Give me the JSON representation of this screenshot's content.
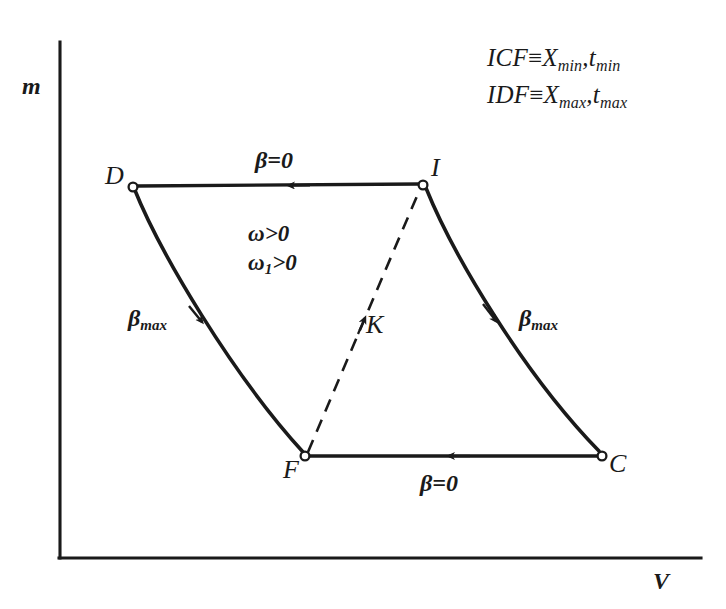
{
  "figure": {
    "type": "diagram",
    "axes": {
      "y_label": "m",
      "x_label": "V"
    },
    "notes": [
      {
        "lhs": "ICF",
        "rel": "≡",
        "rhs_main": "X",
        "rhs_sub": "min",
        "rhs2_main": "t",
        "rhs2_sub": "min",
        "separator": ","
      },
      {
        "lhs": "IDF",
        "rel": "≡",
        "rhs_main": "X",
        "rhs_sub": "max",
        "rhs2_main": "t",
        "rhs2_sub": "max",
        "separator": ","
      }
    ],
    "nodes": [
      {
        "id": "D",
        "label": "D"
      },
      {
        "id": "I",
        "label": "I"
      },
      {
        "id": "F",
        "label": "F"
      },
      {
        "id": "C",
        "label": "C"
      },
      {
        "id": "K",
        "label": "K"
      }
    ],
    "edge_labels": {
      "top": "β=0",
      "bottom": "β=0",
      "left_main": "β",
      "left_sub": "max",
      "right_main": "β",
      "right_sub": "max"
    },
    "conditions": [
      {
        "main": "ω>0",
        "sub": ""
      },
      {
        "main_pre": "ω",
        "sub": "1",
        "main_post": ">0"
      }
    ],
    "colors": {
      "ink": "#1a1a1a",
      "background": "#ffffff"
    }
  }
}
